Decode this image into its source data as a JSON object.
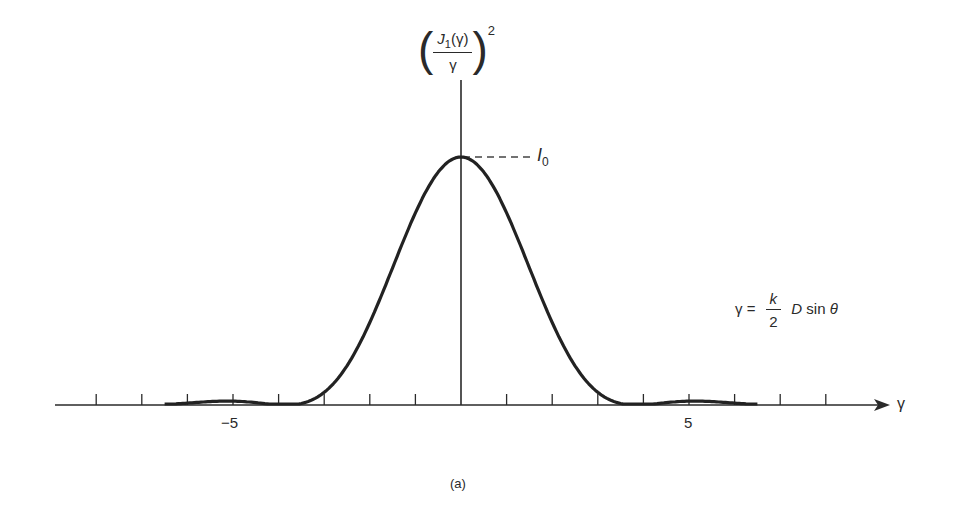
{
  "figure": {
    "panel_label": "(a)",
    "y_axis_label": {
      "numerator": "J",
      "subscript": "1",
      "argument": "(γ)",
      "denominator": "γ",
      "power": "2"
    },
    "x_axis_label": "γ",
    "peak_label": {
      "symbol": "I",
      "subscript": "0"
    },
    "equation": {
      "lhs": "γ =",
      "frac_num": "k",
      "frac_den": "2",
      "rhs_var": "D",
      "rhs_fn": "sin",
      "rhs_angle": "θ"
    },
    "tick_labels": [
      "−5",
      "5"
    ]
  },
  "chart_data": {
    "type": "line",
    "title": "",
    "xlabel": "γ",
    "ylabel": "(J1(γ)/γ)^2",
    "series": [
      {
        "name": "(J1(γ)/γ)^2 (normalized, peak = I0)",
        "x": [
          -6.5,
          -6,
          -5.5,
          -5,
          -4.5,
          -4,
          -3.83,
          -3.5,
          -3,
          -2.5,
          -2,
          -1.5,
          -1,
          -0.5,
          0,
          0.5,
          1,
          1.5,
          2,
          2.5,
          3,
          3.5,
          3.83,
          4,
          4.5,
          5,
          5.5,
          6,
          6.5
        ],
        "y": [
          0.0,
          0.004,
          0.012,
          0.016,
          0.01,
          0.001,
          0.0,
          0.014,
          0.108,
          0.289,
          0.539,
          0.791,
          0.939,
          0.985,
          1.0,
          0.985,
          0.939,
          0.791,
          0.539,
          0.289,
          0.108,
          0.014,
          0.0,
          0.001,
          0.01,
          0.016,
          0.012,
          0.004,
          0.0
        ]
      }
    ],
    "xlim": [
      -8,
      9
    ],
    "ylim": [
      0,
      1.15
    ],
    "x_ticks": [
      -8,
      -7,
      -6,
      -5,
      -4,
      -3,
      -2,
      -1,
      0,
      1,
      2,
      3,
      4,
      5,
      6,
      7,
      8
    ],
    "x_tick_labels": {
      "-5": "−5",
      "5": "5"
    },
    "annotations": [
      "I0 (peak value)",
      "γ = (k/2) D sin θ",
      "(a)"
    ],
    "grid": false,
    "legend": "none"
  }
}
